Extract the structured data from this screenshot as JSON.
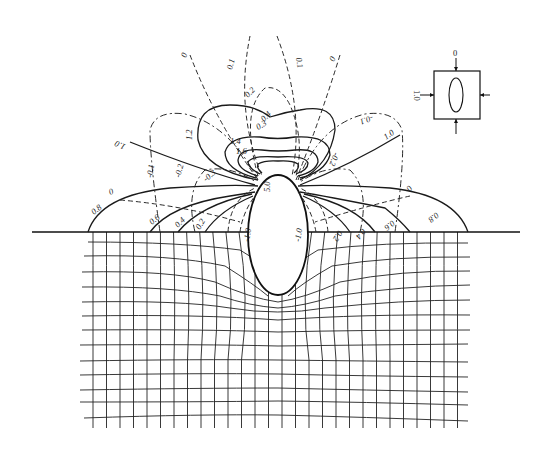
{
  "figure": {
    "ellipse_label": "5.0",
    "ellipse_side_labels": [
      "-1.0",
      "-1.0"
    ],
    "solid_contour_labels": [
      "0.2",
      "0.4",
      "0.6",
      "0.8",
      "1.0",
      "1.2",
      "1.4",
      "1.6"
    ],
    "dashed_contour_labels": [
      "0",
      "0.1",
      "0.2",
      "-0.1",
      "-0.2",
      "-0.3",
      "0.3",
      "0.4"
    ],
    "labels": {
      "l_0_top_left": "0",
      "l_01_top_left": "0.1",
      "l_01_top_right": "0.1",
      "l_0_top_right": "0",
      "l_02_top": "0.2",
      "l_12": "1.2",
      "l_14": "1.4",
      "l_16": "1.6",
      "l_inner_a": "0.3",
      "l_inner_b": "0.4",
      "l_10_left": "1.0",
      "l_10_right": "1.0",
      "l_m01_left": "-0.1",
      "l_m02_left": "-0.2",
      "l_m03_left": "-0.3",
      "l_m02_right": "-0.2",
      "l_m01_right": "-0.1",
      "l_m10_left": "-1.0",
      "l_m10_right": "-1.0",
      "l_50": "5.0",
      "l_08_left": "0.8",
      "l_06_left": "0.6",
      "l_04_left": "0.4",
      "l_02_left": "0.2",
      "l_0_left": "0",
      "l_0_right": "0",
      "l_08_right": "0.8",
      "l_06_right": "0.6",
      "l_04_right": "0.4",
      "l_02_right": "0.2"
    },
    "inset": {
      "top_load_label": "0",
      "side_load_label": "1.0"
    }
  }
}
